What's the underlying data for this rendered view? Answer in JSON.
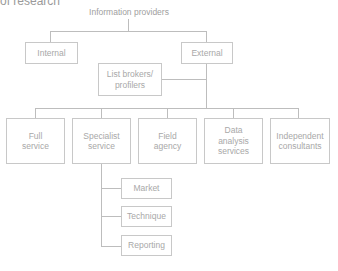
{
  "heading": "of research",
  "diagram": {
    "root": "Information providers",
    "level1": [
      {
        "id": "internal",
        "label": "Internal"
      },
      {
        "id": "external",
        "label": "External"
      }
    ],
    "external_child": {
      "label": "List brokers/\nprofilers"
    },
    "level2": [
      {
        "id": "full-service",
        "label": "Full\nservice"
      },
      {
        "id": "specialist-service",
        "label": "Specialist\nservice"
      },
      {
        "id": "field-agency",
        "label": "Field\nagency"
      },
      {
        "id": "data-analysis-services",
        "label": "Data\nanalysis\nservices"
      },
      {
        "id": "independent-consultants",
        "label": "Independent\nconsultants"
      }
    ],
    "specialist_children": [
      {
        "id": "market",
        "label": "Market"
      },
      {
        "id": "technique",
        "label": "Technique"
      },
      {
        "id": "reporting",
        "label": "Reporting"
      }
    ],
    "colors": {
      "line": "#bdbdbd",
      "box_border": "#c8c8c8",
      "text": "#a8a8a8"
    }
  }
}
